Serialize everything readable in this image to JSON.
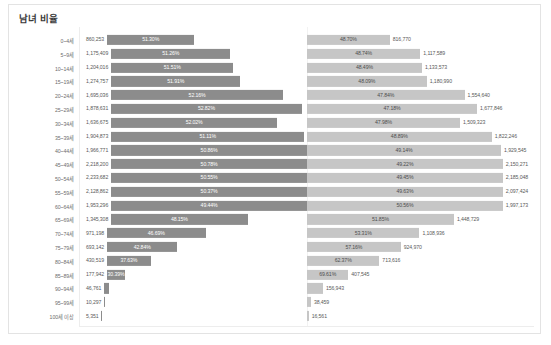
{
  "card": {
    "title": "남녀 비율"
  },
  "chart_data": {
    "type": "bar",
    "subtype": "diverging-population-pyramid",
    "title": "남녀 비율",
    "xlabel": "",
    "ylabel": "",
    "grid": false,
    "legend": null,
    "orientation": "horizontal",
    "max_total": 4403948,
    "series": [
      {
        "name": "남자",
        "color": "#8c8c8c"
      },
      {
        "name": "여자",
        "color": "#c6c6c6"
      }
    ],
    "categories": [
      "0~4세",
      "5~9세",
      "10~14세",
      "15~19세",
      "20~24세",
      "25~29세",
      "30~34세",
      "35~39세",
      "40~44세",
      "45~49세",
      "50~54세",
      "55~59세",
      "60~64세",
      "65~69세",
      "70~74세",
      "75~79세",
      "80~84세",
      "85~89세",
      "90~94세",
      "95~99세",
      "100세 이상"
    ],
    "rows": [
      {
        "category": "0~4세",
        "male_count": "860,253",
        "male_pct": "51.30%",
        "female_pct": "48.70%",
        "female_count": "816,770",
        "male_value": 860253,
        "female_value": 816770,
        "male_ratio": 51.3,
        "female_ratio": 48.7
      },
      {
        "category": "5~9세",
        "male_count": "1,175,409",
        "male_pct": "51.26%",
        "female_pct": "48.74%",
        "female_count": "1,117,589",
        "male_value": 1175409,
        "female_value": 1117589,
        "male_ratio": 51.26,
        "female_ratio": 48.74
      },
      {
        "category": "10~14세",
        "male_count": "1,204,016",
        "male_pct": "51.51%",
        "female_pct": "48.49%",
        "female_count": "1,133,573",
        "male_value": 1204016,
        "female_value": 1133573,
        "male_ratio": 51.51,
        "female_ratio": 48.49
      },
      {
        "category": "15~19세",
        "male_count": "1,274,757",
        "male_pct": "51.91%",
        "female_pct": "48.09%",
        "female_count": "1,180,990",
        "male_value": 1274757,
        "female_value": 1180990,
        "male_ratio": 51.91,
        "female_ratio": 48.09
      },
      {
        "category": "20~24세",
        "male_count": "1,695,036",
        "male_pct": "52.16%",
        "female_pct": "47.84%",
        "female_count": "1,554,640",
        "male_value": 1695036,
        "female_value": 1554640,
        "male_ratio": 52.16,
        "female_ratio": 47.84
      },
      {
        "category": "25~29세",
        "male_count": "1,878,631",
        "male_pct": "52.82%",
        "female_pct": "47.18%",
        "female_count": "1,677,846",
        "male_value": 1878631,
        "female_value": 1677846,
        "male_ratio": 52.82,
        "female_ratio": 47.18
      },
      {
        "category": "30~34세",
        "male_count": "1,636,675",
        "male_pct": "52.02%",
        "female_pct": "47.98%",
        "female_count": "1,509,323",
        "male_value": 1636675,
        "female_value": 1509323,
        "male_ratio": 52.02,
        "female_ratio": 47.98
      },
      {
        "category": "35~39세",
        "male_count": "1,904,873",
        "male_pct": "51.11%",
        "female_pct": "48.89%",
        "female_count": "1,822,246",
        "male_value": 1904873,
        "female_value": 1822246,
        "male_ratio": 51.11,
        "female_ratio": 48.89
      },
      {
        "category": "40~44세",
        "male_count": "1,966,771",
        "male_pct": "50.86%",
        "female_pct": "49.14%",
        "female_count": "1,929,545",
        "male_value": 1966771,
        "female_value": 1929545,
        "male_ratio": 50.86,
        "female_ratio": 49.14
      },
      {
        "category": "45~49세",
        "male_count": "2,218,200",
        "male_pct": "50.78%",
        "female_pct": "49.22%",
        "female_count": "2,150,271",
        "male_value": 2218200,
        "female_value": 2150271,
        "male_ratio": 50.78,
        "female_ratio": 49.22
      },
      {
        "category": "50~54세",
        "male_count": "2,233,682",
        "male_pct": "50.55%",
        "female_pct": "49.45%",
        "female_count": "2,185,048",
        "male_value": 2233682,
        "female_value": 2185048,
        "male_ratio": 50.55,
        "female_ratio": 49.45
      },
      {
        "category": "55~59세",
        "male_count": "2,128,862",
        "male_pct": "50.37%",
        "female_pct": "49.63%",
        "female_count": "2,097,424",
        "male_value": 2128862,
        "female_value": 2097424,
        "male_ratio": 50.37,
        "female_ratio": 49.63
      },
      {
        "category": "60~64세",
        "male_count": "1,953,296",
        "male_pct": "49.44%",
        "female_pct": "50.56%",
        "female_count": "1,997,173",
        "male_value": 1953296,
        "female_value": 1997173,
        "male_ratio": 49.44,
        "female_ratio": 50.56
      },
      {
        "category": "65~69세",
        "male_count": "1,345,308",
        "male_pct": "48.15%",
        "female_pct": "51.85%",
        "female_count": "1,448,729",
        "male_value": 1345308,
        "female_value": 1448729,
        "male_ratio": 48.15,
        "female_ratio": 51.85
      },
      {
        "category": "70~74세",
        "male_count": "971,198",
        "male_pct": "46.69%",
        "female_pct": "53.31%",
        "female_count": "1,108,936",
        "male_value": 971198,
        "female_value": 1108936,
        "male_ratio": 46.69,
        "female_ratio": 53.31
      },
      {
        "category": "75~79세",
        "male_count": "693,142",
        "male_pct": "42.84%",
        "female_pct": "57.16%",
        "female_count": "924,970",
        "male_value": 693142,
        "female_value": 924970,
        "male_ratio": 42.84,
        "female_ratio": 57.16
      },
      {
        "category": "80~84세",
        "male_count": "430,519",
        "male_pct": "37.63%",
        "female_pct": "62.37%",
        "female_count": "713,616",
        "male_value": 430519,
        "female_value": 713616,
        "male_ratio": 37.63,
        "female_ratio": 62.37
      },
      {
        "category": "85~89세",
        "male_count": "177,942",
        "male_pct": "30.39%",
        "female_pct": "69.61%",
        "female_count": "407,545",
        "male_value": 177942,
        "female_value": 407545,
        "male_ratio": 30.39,
        "female_ratio": 69.61
      },
      {
        "category": "90~94세",
        "male_count": "46,761",
        "male_pct": "",
        "female_pct": "",
        "female_count": "156,943",
        "male_value": 46761,
        "female_value": 156943,
        "male_ratio": 22.95,
        "female_ratio": 77.05
      },
      {
        "category": "95~99세",
        "male_count": "10,297",
        "male_pct": "",
        "female_pct": "",
        "female_count": "38,459",
        "male_value": 10297,
        "female_value": 38459,
        "male_ratio": 21.12,
        "female_ratio": 78.88
      },
      {
        "category": "100세 이상",
        "male_count": "5,351",
        "male_pct": "",
        "female_pct": "",
        "female_count": "16,561",
        "male_value": 5351,
        "female_value": 16561,
        "male_ratio": 24.42,
        "female_ratio": 75.58
      }
    ]
  }
}
